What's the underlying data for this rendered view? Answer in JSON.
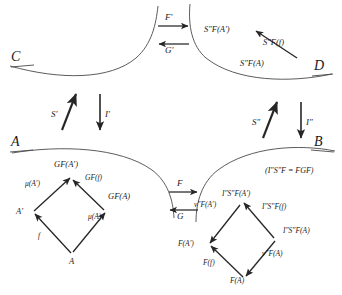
{
  "diagram": {
    "type": "commutative-diagram",
    "stroke_color": "#262626",
    "background": "#ffffff"
  },
  "regions": {
    "top_left": {
      "name": "C"
    },
    "top_right": {
      "name": "D"
    },
    "bottom_left": {
      "name": "A"
    },
    "bottom_right": {
      "name": "B"
    }
  },
  "top_arrows": {
    "forward_label": "F′",
    "backward_label": "G′"
  },
  "middle_arrows": {
    "forward_label": "F",
    "backward_label": "G"
  },
  "left_vertical": {
    "up_label": "S′",
    "down_label": "I′"
  },
  "right_vertical": {
    "up_label": "S″",
    "down_label": "I″"
  },
  "d_objects": {
    "top_left": "S″F(A′)",
    "arrow_label": "S″F(f)",
    "bottom": "S″F(A)"
  },
  "a_diamond": {
    "top": "GF(A′)",
    "left": "A′",
    "right": "GF(A)",
    "bottom": "A",
    "edge_top_left": "μ(A′)",
    "edge_top_right": "GF(f)",
    "edge_bottom_right": "μ(A)",
    "edge_bottom_left": "f"
  },
  "b_diamond": {
    "top": "I″S″F(A′)",
    "left": "F(A′)",
    "right": "I″S″F(A)",
    "bottom": "F(A)",
    "edge_top_left": "ν″F(A′)",
    "edge_top_right": "I″S″F(f)",
    "edge_bottom_right": "ν″F(A)",
    "edge_bottom_left": "F(f)"
  },
  "annotation": {
    "equation": "(I″S″F = FGF)"
  }
}
